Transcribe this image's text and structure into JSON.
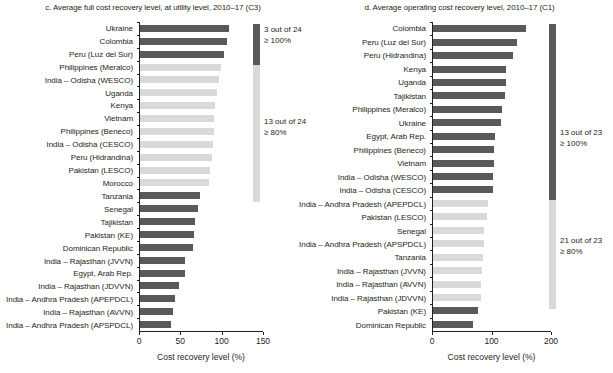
{
  "chart_data": [
    {
      "type": "bar",
      "orientation": "horizontal",
      "panel": "c",
      "title": "c. Average full cost recovery level, at utility level, 2010–17 (C3)",
      "xlabel": "Cost recovery level (%)",
      "ylabel": "",
      "xlim": [
        0,
        150
      ],
      "xticks": [
        0,
        50,
        100,
        150
      ],
      "xtick_labels": [
        "0",
        "50",
        "100",
        "150"
      ],
      "grid": false,
      "categories": [
        "Ukraine",
        "Colombia",
        "Peru (Luz del Sur)",
        "Philippines (Meralco)",
        "India – Odisha (WESCO)",
        "Uganda",
        "Kenya",
        "Vietnam",
        "Philippines (Beneco)",
        "India – Odisha (CESCO)",
        "Peru (Hidrandina)",
        "Pakistan (LESCO)",
        "Morocco",
        "Tanzania",
        "Senegal",
        "Tajikistan",
        "Pakistan (KE)",
        "Dominican Republic",
        "India – Rajasthan (JVVN)",
        "Egypt, Arab Rep.",
        "India – Rajasthan (JDVVN)",
        "India – Andhra Pradesh (APEPDCL)",
        "India – Rajasthan (AVVN)",
        "India – Andhra Pradesh (APSPDCL)"
      ],
      "values": [
        108,
        105,
        102,
        98,
        95,
        93,
        91,
        90,
        89,
        88,
        87,
        85,
        84,
        73,
        70,
        66,
        65,
        64,
        55,
        54,
        47,
        42,
        40,
        37
      ],
      "bar_colors": [
        "#595959",
        "#595959",
        "#595959",
        "#d9d9d9",
        "#d9d9d9",
        "#d9d9d9",
        "#d9d9d9",
        "#d9d9d9",
        "#d9d9d9",
        "#d9d9d9",
        "#d9d9d9",
        "#d9d9d9",
        "#d9d9d9",
        "#595959",
        "#595959",
        "#595959",
        "#595959",
        "#595959",
        "#595959",
        "#595959",
        "#595959",
        "#595959",
        "#595959",
        "#595959"
      ],
      "legend_position": "right",
      "legend": [
        {
          "color": "#595959",
          "count_line": "3 out of 24",
          "threshold_line": "≥ 100%"
        },
        {
          "color": "#d9d9d9",
          "count_line": "13 out of 24",
          "threshold_line": "≥ 80%"
        }
      ]
    },
    {
      "type": "bar",
      "orientation": "horizontal",
      "panel": "d",
      "title": "d. Average operating cost recovery level, 2010–17 (C1)",
      "xlabel": "Cost recovery level (%)",
      "ylabel": "",
      "xlim": [
        0,
        200
      ],
      "xticks": [
        0,
        100,
        200
      ],
      "xtick_labels": [
        "0",
        "100",
        "200"
      ],
      "grid": false,
      "categories": [
        "Colombia",
        "Peru (Luz del Sur)",
        "Peru (Hidrandina)",
        "Kenya",
        "Uganda",
        "Tajikistan",
        "Philippines (Meralco)",
        "Ukraine",
        "Egypt, Arab Rep.",
        "Philippines (Beneco)",
        "Vietnam",
        "India – Odisha (WESCO)",
        "India – Odisha (CESCO)",
        "India – Andhra Pradesh (APEPDCL)",
        "Pakistan (LESCO)",
        "Senegal",
        "India – Andhra Pradesh (APSPDCL)",
        "Tanzania",
        "India – Rajasthan (JVVN)",
        "India – Rajasthan (AVVN)",
        "India – Rajasthan (JDVVN)",
        "Pakistan (KE)",
        "Dominican Republic"
      ],
      "values": [
        156,
        142,
        134,
        122,
        122,
        121,
        116,
        115,
        104,
        103,
        102,
        101,
        100,
        93,
        90,
        86,
        86,
        84,
        83,
        80,
        80,
        75,
        68
      ],
      "bar_colors": [
        "#595959",
        "#595959",
        "#595959",
        "#595959",
        "#595959",
        "#595959",
        "#595959",
        "#595959",
        "#595959",
        "#595959",
        "#595959",
        "#595959",
        "#595959",
        "#d9d9d9",
        "#d9d9d9",
        "#d9d9d9",
        "#d9d9d9",
        "#d9d9d9",
        "#d9d9d9",
        "#d9d9d9",
        "#d9d9d9",
        "#595959",
        "#595959"
      ],
      "legend_position": "right",
      "legend": [
        {
          "color": "#595959",
          "count_line": "13 out of 23",
          "threshold_line": "≥ 100%"
        },
        {
          "color": "#d9d9d9",
          "count_line": "21 out of 23",
          "threshold_line": "≥ 80%"
        }
      ]
    }
  ],
  "left": {
    "title": "c. Average full cost recovery level, at utility level, 2010–17 (C3)",
    "axis_title": "Cost recovery level (%)",
    "legend_note_1_count": "3 out of 24",
    "legend_note_1_threshold": "≥ 100%",
    "legend_note_2_count": "13 out of 24",
    "legend_note_2_threshold": "≥ 80%"
  },
  "right": {
    "title": "d. Average operating cost recovery level, 2010–17 (C1)",
    "axis_title": "Cost recovery level (%)",
    "legend_note_1_count": "13 out of 23",
    "legend_note_1_threshold": "≥ 100%",
    "legend_note_2_count": "21 out of 23",
    "legend_note_2_threshold": "≥ 80%"
  },
  "colors": {
    "bar_dark": "#595959",
    "bar_light": "#d9d9d9",
    "axis": "#231f20",
    "text": "#231f20",
    "background": "#ffffff"
  }
}
